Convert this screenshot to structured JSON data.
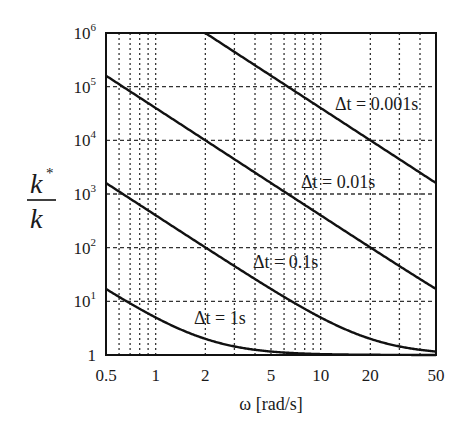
{
  "chart_data": {
    "type": "line",
    "title": "",
    "xlabel": "ω [rad/s]",
    "ylabel": "k*/k",
    "xscale": "log",
    "yscale": "log",
    "xlim": [
      0.5,
      50
    ],
    "ylim": [
      1,
      1000000
    ],
    "grid": true,
    "legend": "none (inline curve labels)",
    "x_ticks": [
      "0.5",
      "1",
      "2",
      "5",
      "10",
      "20",
      "50"
    ],
    "y_ticks": [
      "1",
      "10^1",
      "10^2",
      "10^3",
      "10^4",
      "10^5",
      "10^6"
    ],
    "x": [
      0.5,
      0.7,
      1,
      2,
      5,
      10,
      20,
      50
    ],
    "series": [
      {
        "name": "Δt = 0.001s",
        "label": "Δt = 0.001s",
        "dt": 0.001,
        "values": [
          null,
          null,
          null,
          1000000,
          160000,
          40000,
          10000,
          1600
        ]
      },
      {
        "name": "Δt = 0.01s",
        "label": "Δt = 0.01s",
        "dt": 0.01,
        "values": [
          160000,
          81600,
          40000,
          10000,
          1600,
          400,
          100,
          16
        ]
      },
      {
        "name": "Δt = 0.1s",
        "label": "Δt = 0.1s",
        "dt": 0.1,
        "values": [
          1600,
          817,
          400,
          100,
          17,
          5,
          2,
          1.16
        ]
      },
      {
        "name": "Δt = 1s",
        "label": "Δt = 1s",
        "dt": 1,
        "values": [
          17,
          9.2,
          5,
          2,
          1.16,
          1.04,
          1.01,
          1.0
        ]
      }
    ],
    "annotations": [
      {
        "text": "Δt = 0.001s",
        "x": 15,
        "y": 4000
      },
      {
        "text": "Δt = 0.01s",
        "x": 9,
        "y": 1800
      },
      {
        "text": "Δt = 0.1s",
        "x": 4.5,
        "y": 180
      },
      {
        "text": "Δt = 1s",
        "x": 2,
        "y": 11
      }
    ]
  },
  "labels": {
    "x_axis": "ω [rad/s]",
    "y_num": "k",
    "y_star": "*",
    "y_den": "k",
    "curve_0001": "Δt = 0.001s",
    "curve_001": "Δt = 0.01s",
    "curve_01": "Δt = 0.1s",
    "curve_1": "Δt = 1s"
  },
  "style": {
    "line_color": "#111111",
    "grid_color": "#333333",
    "background": "#ffffff"
  }
}
